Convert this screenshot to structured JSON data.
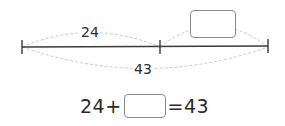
{
  "diagram": {
    "type": "part-whole bar model",
    "segments": [
      {
        "label": "24",
        "from": "left-end",
        "to": "middle-tick"
      },
      {
        "label": "",
        "from": "middle-tick",
        "to": "right-end",
        "answer_box": true
      }
    ],
    "total": {
      "label": "43"
    }
  },
  "equation": {
    "left": "24+",
    "blank": "",
    "right": "=43"
  },
  "colors": {
    "line": "#3a3a3a",
    "arc": "#c8c8c8",
    "box_border": "#8a8a8a",
    "text": "#2a2a2a"
  }
}
